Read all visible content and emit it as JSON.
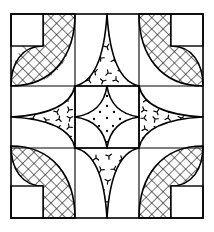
{
  "figure": {
    "caption": "Symmetrical pieced quilt block with crosshatched corner petals, dotted center star and speckled edge triangles",
    "background_color": "#ffffff",
    "ink_color": "#000000",
    "canvas": {
      "width": 214,
      "height": 232
    }
  },
  "frame": {
    "name": "outer-border",
    "x": 11,
    "y": 14,
    "width": 192,
    "height": 204,
    "stroke_width": 1.6,
    "stroke_color": "#000000",
    "fill": "none"
  },
  "grid": {
    "name": "nine-patch-grid",
    "columns": 3,
    "rows": 3,
    "vertical_lines_x": [
      75,
      139
    ],
    "horizontal_lines_y": [
      86,
      148
    ],
    "stroke_width": 1.1,
    "stroke_color": "#000000"
  },
  "cells": {
    "x_edges": [
      11,
      75,
      139,
      203
    ],
    "y_edges": [
      14,
      86,
      148,
      218
    ]
  },
  "fills": {
    "crosshatch": {
      "label": "crosshatch",
      "spacing": 8,
      "angle_degrees": 45,
      "stroke_width": 1.1,
      "stroke_color": "#000000"
    },
    "speckle": {
      "label": "speckle-ticks",
      "glyph": "bird-foot-tick",
      "stroke_width": 1.2,
      "stroke_color": "#000000",
      "density": "medium"
    },
    "dots": {
      "label": "fine-dots",
      "radius": 1.15,
      "fill_color": "#000000",
      "density": "medium"
    },
    "plain": {
      "label": "plain-white",
      "fill_color": "#ffffff"
    }
  },
  "corner_blocks": [
    {
      "name": "corner-petal-top-left",
      "position": "top-left",
      "fill": "crosshatch",
      "notch_label": "white-corner-square",
      "notch_size": 32
    },
    {
      "name": "corner-petal-top-right",
      "position": "top-right",
      "fill": "crosshatch",
      "notch_label": "white-corner-square",
      "notch_size": 32
    },
    {
      "name": "corner-petal-bottom-left",
      "position": "bottom-left",
      "fill": "crosshatch",
      "notch_label": "white-corner-square",
      "notch_size": 32
    },
    {
      "name": "corner-petal-bottom-right",
      "position": "bottom-right",
      "fill": "crosshatch",
      "notch_label": "white-corner-square",
      "notch_size": 32
    }
  ],
  "edge_blocks": [
    {
      "name": "edge-triangle-top",
      "position": "top",
      "fill": "speckle",
      "points_toward": "center"
    },
    {
      "name": "edge-triangle-left",
      "position": "left",
      "fill": "speckle",
      "points_toward": "center"
    },
    {
      "name": "edge-triangle-right",
      "position": "right",
      "fill": "speckle",
      "points_toward": "center"
    },
    {
      "name": "edge-triangle-bottom",
      "position": "bottom",
      "fill": "speckle",
      "points_toward": "center"
    }
  ],
  "center_block": {
    "name": "center-star",
    "shape": "four-pointed-astroid",
    "fill": "dots",
    "cx": 107,
    "cy": 117,
    "half_width": 32,
    "half_height": 31
  },
  "speckle_points": {
    "top": [
      [
        100,
        33
      ],
      [
        112,
        36
      ],
      [
        94,
        45
      ],
      [
        107,
        47
      ],
      [
        119,
        44
      ],
      [
        88,
        57
      ],
      [
        101,
        58
      ],
      [
        114,
        60
      ],
      [
        126,
        56
      ],
      [
        82,
        70
      ],
      [
        95,
        72
      ],
      [
        108,
        73
      ],
      [
        121,
        71
      ],
      [
        133,
        68
      ],
      [
        89,
        80
      ],
      [
        103,
        81
      ],
      [
        116,
        80
      ],
      [
        128,
        78
      ]
    ],
    "bottom": [
      [
        96,
        158
      ],
      [
        109,
        156
      ],
      [
        122,
        159
      ],
      [
        88,
        168
      ],
      [
        101,
        170
      ],
      [
        114,
        169
      ],
      [
        127,
        167
      ],
      [
        95,
        180
      ],
      [
        108,
        181
      ],
      [
        120,
        179
      ],
      [
        102,
        192
      ],
      [
        114,
        191
      ],
      [
        108,
        202
      ]
    ],
    "left": [
      [
        56,
        100
      ],
      [
        68,
        98
      ],
      [
        44,
        110
      ],
      [
        57,
        112
      ],
      [
        69,
        110
      ],
      [
        33,
        118
      ],
      [
        46,
        120
      ],
      [
        59,
        119
      ],
      [
        70,
        118
      ],
      [
        45,
        129
      ],
      [
        58,
        128
      ],
      [
        69,
        127
      ],
      [
        57,
        138
      ],
      [
        68,
        136
      ]
    ],
    "right": [
      [
        146,
        100
      ],
      [
        158,
        98
      ],
      [
        144,
        110
      ],
      [
        157,
        112
      ],
      [
        170,
        110
      ],
      [
        144,
        118
      ],
      [
        155,
        119
      ],
      [
        168,
        118
      ],
      [
        181,
        118
      ],
      [
        145,
        129
      ],
      [
        157,
        128
      ],
      [
        169,
        127
      ],
      [
        146,
        138
      ],
      [
        157,
        136
      ]
    ]
  },
  "dot_points": [
    [
      107,
      96
    ],
    [
      99,
      101
    ],
    [
      115,
      101
    ],
    [
      93,
      107
    ],
    [
      107,
      106
    ],
    [
      121,
      107
    ],
    [
      88,
      113
    ],
    [
      100,
      112
    ],
    [
      114,
      112
    ],
    [
      126,
      113
    ],
    [
      94,
      119
    ],
    [
      107,
      118
    ],
    [
      120,
      119
    ],
    [
      86,
      122
    ],
    [
      128,
      122
    ],
    [
      99,
      126
    ],
    [
      113,
      126
    ],
    [
      92,
      131
    ],
    [
      107,
      131
    ],
    [
      122,
      131
    ],
    [
      100,
      137
    ],
    [
      114,
      137
    ],
    [
      107,
      142
    ]
  ],
  "accessibility": {
    "alt_text": "Black and white line drawing of a symmetric quilt block divided into a three by three grid"
  }
}
